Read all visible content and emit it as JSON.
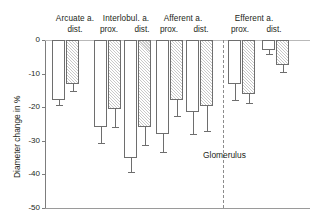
{
  "chart_data": {
    "type": "bar",
    "title": "",
    "xlabel": "",
    "ylabel": "Diameter change in %",
    "ylim": [
      -50,
      0
    ],
    "ytick_labels": [
      "0",
      "-10",
      "-20",
      "-30",
      "-40",
      "-50"
    ],
    "ytick_values": [
      0,
      -10,
      -20,
      -30,
      -40,
      -50
    ],
    "grid": false,
    "legend_position": "none",
    "annotations": [
      {
        "text": "Glomerulus",
        "note": "label beside dashed vertical divider separating afferent from efferent vessels"
      }
    ],
    "group_headers": [
      {
        "label": "Arcuate a.",
        "subs": [
          "dist."
        ]
      },
      {
        "label": "Interlobul. a.",
        "subs": [
          "prox.",
          "dist."
        ]
      },
      {
        "label": "Afferent a.",
        "subs": [
          "prox.",
          "dist."
        ]
      },
      {
        "label": "Efferent a.",
        "subs": [
          "prox.",
          "dist."
        ]
      }
    ],
    "categories": [
      "Arcuate a. dist.",
      "Interlobul. a. prox.",
      "Interlobul. a. dist.",
      "Afferent a. prox.",
      "Afferent a. dist.",
      "Efferent a. prox.",
      "Efferent a. dist."
    ],
    "series": [
      {
        "name": "open",
        "fill": "white",
        "values": [
          -18.0,
          -26.0,
          -35.0,
          -28.0,
          -21.5,
          -13.0,
          -3.0
        ],
        "errors": [
          1.3,
          4.8,
          4.2,
          5.2,
          6.5,
          4.8,
          1.3
        ]
      },
      {
        "name": "hatched",
        "fill": "hatched",
        "values": [
          -13.2,
          -20.5,
          -26.0,
          -18.0,
          -19.5,
          -16.0,
          -7.5
        ],
        "errors": [
          2.0,
          5.5,
          5.2,
          4.5,
          7.5,
          2.8,
          2.0
        ]
      }
    ],
    "bars": [
      {
        "group": "Arcuate a.",
        "sub": "dist.",
        "fill": "white",
        "value": -18.0,
        "err": 1.3
      },
      {
        "group": "Arcuate a.",
        "sub": "dist.",
        "fill": "hatched",
        "value": -13.2,
        "err": 2.0
      },
      {
        "group": "Interlobul. a.",
        "sub": "prox.",
        "fill": "white",
        "value": -26.0,
        "err": 4.8
      },
      {
        "group": "Interlobul. a.",
        "sub": "prox.",
        "fill": "hatched",
        "value": -20.5,
        "err": 5.5
      },
      {
        "group": "Interlobul. a.",
        "sub": "dist.",
        "fill": "white",
        "value": -35.0,
        "err": 4.2
      },
      {
        "group": "Interlobul. a.",
        "sub": "dist.",
        "fill": "hatched",
        "value": -26.0,
        "err": 5.2
      },
      {
        "group": "Afferent a.",
        "sub": "prox.",
        "fill": "white",
        "value": -28.0,
        "err": 5.2
      },
      {
        "group": "Afferent a.",
        "sub": "prox.",
        "fill": "hatched",
        "value": -18.0,
        "err": 4.5
      },
      {
        "group": "Afferent a.",
        "sub": "dist.",
        "fill": "white",
        "value": -21.5,
        "err": 6.5
      },
      {
        "group": "Afferent a.",
        "sub": "dist.",
        "fill": "hatched",
        "value": -19.5,
        "err": 7.5
      },
      {
        "group": "Efferent a.",
        "sub": "prox.",
        "fill": "white",
        "value": -13.0,
        "err": 4.8
      },
      {
        "group": "Efferent a.",
        "sub": "prox.",
        "fill": "hatched",
        "value": -16.0,
        "err": 2.8
      },
      {
        "group": "Efferent a.",
        "sub": "dist.",
        "fill": "white",
        "value": -3.0,
        "err": 1.3
      },
      {
        "group": "Efferent a.",
        "sub": "dist.",
        "fill": "hatched",
        "value": -7.5,
        "err": 2.0
      }
    ]
  },
  "axis": {
    "ylabel": "Diameter change in %",
    "ticks": [
      "0",
      "-10",
      "-20",
      "-30",
      "-40",
      "-50"
    ]
  },
  "headers": {
    "g0_title": "Arcuate a.",
    "g0_s0": "dist.",
    "g1_title": "Interlobul. a.",
    "g1_s0": "prox.",
    "g1_s1": "dist.",
    "g2_title": "Afferent a.",
    "g2_s0": "prox.",
    "g2_s1": "dist.",
    "g3_title": "Efferent a.",
    "g3_s0": "prox.",
    "g3_s1": "dist."
  },
  "divider": {
    "label": "Glomerulus"
  },
  "colors": {
    "axis": "#7d7d7d",
    "bar_stroke": "#6e6e6e",
    "hatch": "#c9c9c9",
    "text": "#231f20",
    "divider": "#8c8c8c"
  }
}
